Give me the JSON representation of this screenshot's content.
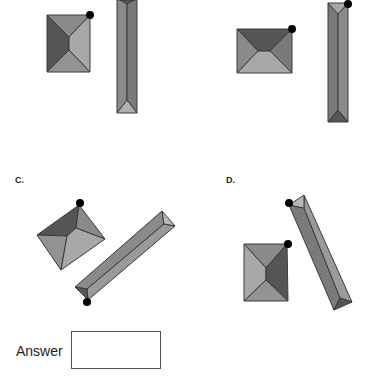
{
  "options": [
    {
      "id": "A",
      "label": ""
    },
    {
      "id": "B",
      "label": ""
    },
    {
      "id": "C",
      "label": "C."
    },
    {
      "id": "D",
      "label": "D."
    }
  ],
  "answer": {
    "label": "Answer",
    "value": ""
  },
  "colors": {
    "face_dark": "#555555",
    "face_mid": "#8a8a8a",
    "face_light": "#a8a8a8",
    "face_lighter": "#b8b8b8",
    "edge": "#333333",
    "dot": "#000000"
  }
}
